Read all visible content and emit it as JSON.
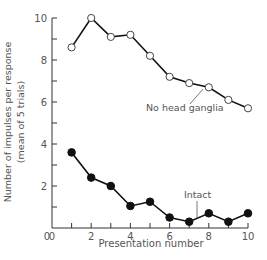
{
  "chart_data": {
    "type": "line",
    "title": "",
    "xlabel": "Presentation number",
    "ylabel": "Number of impulses per response",
    "ylabel_sub": "(mean of 5 trials)",
    "xlim": [
      0,
      10
    ],
    "ylim": [
      0,
      10
    ],
    "xticks_labeled": [
      0,
      2,
      4,
      6,
      8,
      10
    ],
    "xticks_minor": [
      1,
      3,
      5,
      7,
      9
    ],
    "yticks_labeled": [
      2,
      4,
      6,
      8,
      10
    ],
    "yticks_minor": [
      1,
      3,
      5,
      7,
      9
    ],
    "grid": false,
    "legend": "inline annotations",
    "x": [
      1,
      2,
      3,
      4,
      5,
      6,
      7,
      8,
      9,
      10
    ],
    "series": [
      {
        "name": "No head ganglia",
        "marker": "open-circle",
        "values": [
          8.6,
          10.0,
          9.1,
          9.2,
          8.2,
          7.2,
          6.9,
          6.7,
          6.1,
          5.7
        ],
        "annotation": {
          "label": "No head ganglia",
          "label_x": 146,
          "label_y": 111,
          "line": [
            190,
            104,
            203,
            89
          ]
        }
      },
      {
        "name": "Intact",
        "marker": "filled-circle",
        "values": [
          3.6,
          2.4,
          2.0,
          1.05,
          1.25,
          0.5,
          0.3,
          0.7,
          0.3,
          0.7
        ],
        "annotation": {
          "label": "Intact",
          "label_x": 184,
          "label_y": 198,
          "line": [
            197,
            201,
            197,
            218
          ]
        }
      }
    ]
  },
  "axis": {
    "x_label": "Presentation number",
    "y_label": "Number of impulses per response",
    "y_label_sub": "(mean of 5 trials)",
    "origin_label": "0"
  }
}
